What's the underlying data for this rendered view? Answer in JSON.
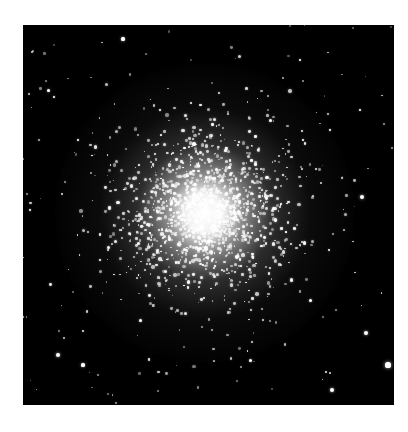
{
  "image": {
    "subject": "globular star cluster",
    "background_color": "#000000",
    "page_color": "#ffffff",
    "frame": {
      "x": 23,
      "y": 25,
      "width": 371,
      "height": 380
    },
    "core_center": {
      "x": 205,
      "y": 213
    },
    "caption": "Globular star cluster"
  },
  "bright_stars": [
    {
      "x": 123,
      "y": 39,
      "r": 1.6
    },
    {
      "x": 48,
      "y": 90,
      "r": 1.5
    },
    {
      "x": 78,
      "y": 140,
      "r": 1.3
    },
    {
      "x": 54,
      "y": 97,
      "r": 1.4
    },
    {
      "x": 362,
      "y": 197,
      "r": 2.2
    },
    {
      "x": 388,
      "y": 365,
      "r": 2.6
    },
    {
      "x": 366,
      "y": 333,
      "r": 2.0
    },
    {
      "x": 332,
      "y": 390,
      "r": 2.0
    },
    {
      "x": 58,
      "y": 355,
      "r": 2.0
    },
    {
      "x": 83,
      "y": 365,
      "r": 1.6
    },
    {
      "x": 310,
      "y": 300,
      "r": 1.5
    },
    {
      "x": 300,
      "y": 60,
      "r": 1.3
    },
    {
      "x": 30,
      "y": 210,
      "r": 1.3
    },
    {
      "x": 140,
      "y": 320,
      "r": 1.5
    },
    {
      "x": 250,
      "y": 360,
      "r": 1.5
    },
    {
      "x": 100,
      "y": 260,
      "r": 1.4
    },
    {
      "x": 330,
      "y": 130,
      "r": 1.4
    },
    {
      "x": 360,
      "y": 110,
      "r": 1.2
    },
    {
      "x": 270,
      "y": 120,
      "r": 1.5
    },
    {
      "x": 160,
      "y": 110,
      "r": 1.3
    }
  ]
}
